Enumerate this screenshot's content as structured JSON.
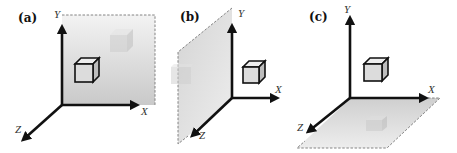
{
  "figure": {
    "colors": {
      "axis": "#111111",
      "plane_fill_light": "#f2f2f2",
      "plane_fill_dark": "#cfcfcf",
      "plane_edge": "#777777",
      "cube_front": "#dcdcdc",
      "cube_side": "#bdbdbd",
      "cube_top": "#eeeeee",
      "faded_cube": "#d6d6d6"
    },
    "panels": [
      {
        "label": "(a)",
        "plane": "XY",
        "axes": {
          "x": "X",
          "y": "Y",
          "z": "Z"
        }
      },
      {
        "label": "(b)",
        "plane": "YZ",
        "axes": {
          "x": "X",
          "y": "Y",
          "z": "Z"
        }
      },
      {
        "label": "(c)",
        "plane": "XZ",
        "axes": {
          "x": "X",
          "y": "Y",
          "z": "Z"
        }
      }
    ]
  }
}
